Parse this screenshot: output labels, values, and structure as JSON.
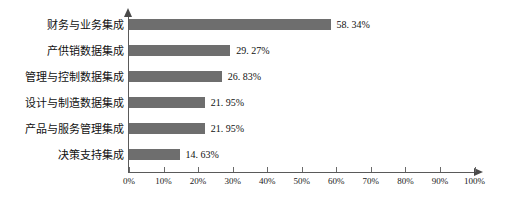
{
  "chart_data": {
    "type": "bar",
    "orientation": "horizontal",
    "title": "",
    "xlabel": "",
    "ylabel": "",
    "xlim": [
      0,
      100
    ],
    "grid": false,
    "legend": null,
    "categories": [
      "财务与业务集成",
      "产供销数据集成",
      "管理与控制数据集成",
      "设计与制造数据集成",
      "产品与服务管理集成",
      "决策支持集成"
    ],
    "values": [
      58.34,
      29.27,
      26.83,
      21.95,
      21.95,
      14.63
    ],
    "value_labels": [
      "58. 34%",
      "29. 27%",
      "26. 83%",
      "21. 95%",
      "21. 95%",
      "14. 63%"
    ],
    "tick_values": [
      0,
      10,
      20,
      30,
      40,
      50,
      60,
      70,
      80,
      90,
      100
    ],
    "tick_labels": [
      "0%",
      "10%",
      "20%",
      "30%",
      "40%",
      "50%",
      "60%",
      "70%",
      "80%",
      "90%",
      "100%"
    ],
    "bar_color": "#6e6e6e",
    "axis_color": "#5a5a5a",
    "background": "#ffffff"
  }
}
